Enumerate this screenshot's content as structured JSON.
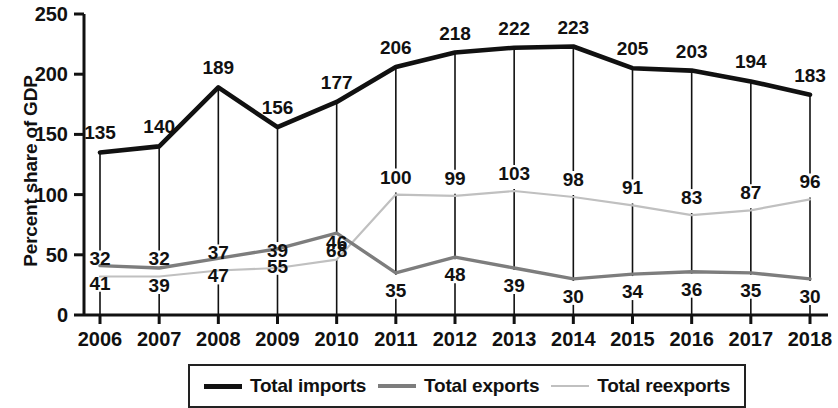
{
  "chart_data": {
    "type": "line",
    "title": "",
    "xlabel": "",
    "ylabel": "Percent share of GDP",
    "categories": [
      "2006",
      "2007",
      "2008",
      "2009",
      "2010",
      "2011",
      "2012",
      "2013",
      "2014",
      "2015",
      "2016",
      "2017",
      "2018"
    ],
    "ylim": [
      0,
      250
    ],
    "yticks": [
      "0",
      "50",
      "100",
      "150",
      "200",
      "250"
    ],
    "grid": false,
    "legend_position": "bottom",
    "series": [
      {
        "name": "Total imports",
        "color": "#111111",
        "values": [
          135,
          140,
          189,
          156,
          177,
          206,
          218,
          222,
          223,
          205,
          203,
          194,
          183
        ],
        "label_position": "above"
      },
      {
        "name": "Total exports",
        "color": "#7d7d7d",
        "values": [
          41,
          39,
          47,
          55,
          68,
          35,
          48,
          39,
          30,
          34,
          36,
          35,
          30
        ],
        "label_position": "below"
      },
      {
        "name": "Total reexports",
        "color": "#c0c0c0",
        "values": [
          32,
          32,
          37,
          39,
          46,
          100,
          99,
          103,
          98,
          91,
          83,
          87,
          96
        ],
        "label_position": "above"
      }
    ]
  },
  "axis": {
    "y_title": "Percent share of GDP"
  },
  "legend": {
    "items": [
      {
        "label": "Total imports"
      },
      {
        "label": "Total exports"
      },
      {
        "label": "Total reexports"
      }
    ]
  }
}
